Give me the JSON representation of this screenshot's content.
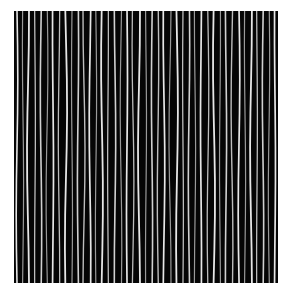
{
  "image": {
    "subject": "stripe texture",
    "description": "Black square filled with thin, slightly wavy near-vertical white and grey lines",
    "background_color": "#050505",
    "line_colors": [
      "#e6e6e6",
      "#bdbdbd",
      "#9a9a9a",
      "#d0d0d0"
    ],
    "width": 264,
    "height": 272,
    "lines": [
      {
        "x": 3,
        "w": 1.6,
        "c": 0,
        "d": 0.8
      },
      {
        "x": 9,
        "w": 1.2,
        "c": 2,
        "d": -0.6
      },
      {
        "x": 14,
        "w": 1.8,
        "c": 0,
        "d": 1.0
      },
      {
        "x": 21,
        "w": 1.3,
        "c": 1,
        "d": -0.4
      },
      {
        "x": 27,
        "w": 1.6,
        "c": 3,
        "d": 0.7
      },
      {
        "x": 33,
        "w": 1.2,
        "c": 2,
        "d": -0.9
      },
      {
        "x": 39,
        "w": 1.7,
        "c": 0,
        "d": 0.5
      },
      {
        "x": 45,
        "w": 1.3,
        "c": 1,
        "d": -0.7
      },
      {
        "x": 52,
        "w": 1.8,
        "c": 0,
        "d": 1.1
      },
      {
        "x": 58,
        "w": 1.2,
        "c": 2,
        "d": -0.5
      },
      {
        "x": 64,
        "w": 1.6,
        "c": 3,
        "d": 0.6
      },
      {
        "x": 70,
        "w": 1.4,
        "c": 1,
        "d": -1.0
      },
      {
        "x": 76,
        "w": 1.7,
        "c": 0,
        "d": 0.8
      },
      {
        "x": 82,
        "w": 1.2,
        "c": 2,
        "d": -0.6
      },
      {
        "x": 88,
        "w": 1.8,
        "c": 0,
        "d": 0.9
      },
      {
        "x": 94,
        "w": 1.3,
        "c": 1,
        "d": -0.4
      },
      {
        "x": 101,
        "w": 1.6,
        "c": 3,
        "d": 0.7
      },
      {
        "x": 107,
        "w": 1.2,
        "c": 2,
        "d": -0.8
      },
      {
        "x": 113,
        "w": 1.7,
        "c": 0,
        "d": 0.5
      },
      {
        "x": 119,
        "w": 1.3,
        "c": 1,
        "d": -0.9
      },
      {
        "x": 125,
        "w": 1.8,
        "c": 0,
        "d": 1.0
      },
      {
        "x": 132,
        "w": 1.2,
        "c": 2,
        "d": -0.5
      },
      {
        "x": 138,
        "w": 1.6,
        "c": 3,
        "d": 0.6
      },
      {
        "x": 144,
        "w": 1.4,
        "c": 1,
        "d": -0.7
      },
      {
        "x": 150,
        "w": 1.7,
        "c": 0,
        "d": 0.8
      },
      {
        "x": 156,
        "w": 1.2,
        "c": 2,
        "d": -1.0
      },
      {
        "x": 163,
        "w": 1.8,
        "c": 0,
        "d": 0.9
      },
      {
        "x": 169,
        "w": 1.3,
        "c": 1,
        "d": -0.4
      },
      {
        "x": 175,
        "w": 1.6,
        "c": 3,
        "d": 0.7
      },
      {
        "x": 181,
        "w": 1.2,
        "c": 2,
        "d": -0.6
      },
      {
        "x": 187,
        "w": 1.7,
        "c": 0,
        "d": 0.5
      },
      {
        "x": 194,
        "w": 1.3,
        "c": 1,
        "d": -0.8
      },
      {
        "x": 200,
        "w": 1.8,
        "c": 0,
        "d": 1.0
      },
      {
        "x": 206,
        "w": 1.2,
        "c": 2,
        "d": -0.5
      },
      {
        "x": 212,
        "w": 1.6,
        "c": 3,
        "d": 0.6
      },
      {
        "x": 218,
        "w": 1.4,
        "c": 1,
        "d": -0.9
      },
      {
        "x": 225,
        "w": 1.7,
        "c": 0,
        "d": 0.8
      },
      {
        "x": 231,
        "w": 1.2,
        "c": 2,
        "d": -0.6
      },
      {
        "x": 237,
        "w": 1.8,
        "c": 0,
        "d": 0.9
      },
      {
        "x": 243,
        "w": 1.3,
        "c": 1,
        "d": -0.4
      },
      {
        "x": 249,
        "w": 1.6,
        "c": 3,
        "d": 0.7
      },
      {
        "x": 255,
        "w": 1.2,
        "c": 2,
        "d": -0.7
      },
      {
        "x": 261,
        "w": 1.7,
        "c": 0,
        "d": 0.5
      }
    ]
  }
}
